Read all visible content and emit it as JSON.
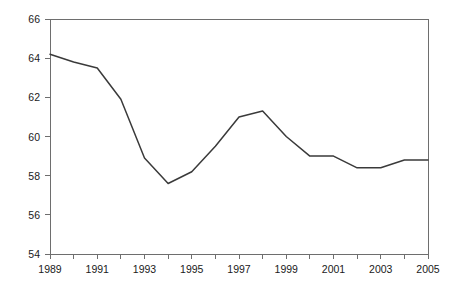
{
  "chart_data": {
    "type": "line",
    "title": "",
    "subtitle": "",
    "xlabel": "",
    "ylabel": "",
    "xlim": [
      1989,
      2005
    ],
    "ylim": [
      54,
      66
    ],
    "grid": false,
    "legend": false,
    "legend_position": "none",
    "line_color": "#3a3a3a",
    "axis_color": "#6e6e6e",
    "background_color": "#ffffff",
    "x": [
      1989,
      1990,
      1991,
      1992,
      1993,
      1994,
      1995,
      1996,
      1997,
      1998,
      1999,
      2000,
      2001,
      2002,
      2003,
      2004,
      2005
    ],
    "values": [
      64.2,
      63.8,
      63.5,
      61.9,
      58.9,
      57.6,
      58.2,
      59.5,
      61.0,
      61.3,
      60.0,
      59.0,
      59.0,
      58.4,
      58.4,
      58.8,
      58.8
    ],
    "y_ticks": [
      54,
      56,
      58,
      60,
      62,
      64,
      66
    ],
    "y_tick_labels": [
      "54",
      "56",
      "58",
      "60",
      "62",
      "64",
      "66"
    ],
    "x_ticks": [
      1989,
      1990,
      1991,
      1992,
      1993,
      1994,
      1995,
      1996,
      1997,
      1998,
      1999,
      2000,
      2001,
      2002,
      2003,
      2004,
      2005
    ],
    "x_tick_labels_shown": [
      "1989",
      "1991",
      "1993",
      "1995",
      "1997",
      "1999",
      "2001",
      "2003",
      "2005"
    ],
    "x_tick_labels_shown_values": [
      1989,
      1991,
      1993,
      1995,
      1997,
      1999,
      2001,
      2003,
      2005
    ]
  }
}
